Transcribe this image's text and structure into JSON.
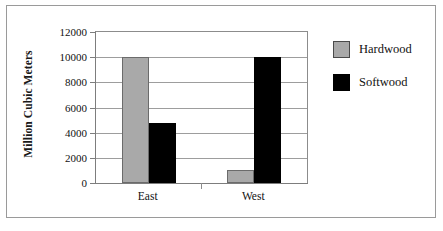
{
  "chart_data": {
    "type": "bar",
    "title": "",
    "xlabel": "",
    "ylabel": "Million Cubic Meters",
    "categories": [
      "East",
      "West"
    ],
    "series": [
      {
        "name": "Hardwood",
        "color": "#a9a9a9",
        "values": [
          10000,
          1000
        ]
      },
      {
        "name": "Softwood",
        "color": "#000000",
        "values": [
          4800,
          10000
        ]
      }
    ],
    "ylim": [
      0,
      12000
    ],
    "yticks": [
      0,
      2000,
      4000,
      6000,
      8000,
      10000,
      12000
    ],
    "ytick_labels": [
      "0",
      "2000",
      "4000",
      "6000",
      "8000",
      "10000",
      "12000"
    ],
    "grid": true,
    "legend_position": "right"
  },
  "legend": {
    "items": [
      {
        "label": "Hardwood"
      },
      {
        "label": "Softwood"
      }
    ]
  },
  "axes": {
    "y_title": "Million Cubic Meters",
    "x_categories": [
      {
        "label": "East"
      },
      {
        "label": "West"
      }
    ]
  }
}
